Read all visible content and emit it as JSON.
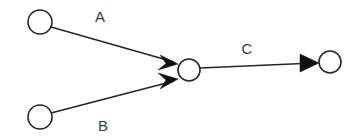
{
  "diagram": {
    "type": "directed-graph",
    "background_color": "#ffffff",
    "stroke_color": "#262626",
    "arrow_color": "#111111",
    "label_color": "#3a3a3a",
    "nodes": [
      {
        "id": "n1",
        "name": "node-top-left",
        "cx": 40,
        "cy": 22,
        "r": 12
      },
      {
        "id": "n2",
        "name": "node-bottom-left",
        "cx": 40,
        "cy": 117,
        "r": 12
      },
      {
        "id": "n3",
        "name": "node-center",
        "cx": 189,
        "cy": 70,
        "r": 11
      },
      {
        "id": "n4",
        "name": "node-right",
        "cx": 330,
        "cy": 62,
        "r": 11
      }
    ],
    "edges": [
      {
        "id": "e1",
        "name": "edge-a",
        "label": "A",
        "from": "n1",
        "to": "n3",
        "x1": 51,
        "y1": 27,
        "x2": 178,
        "y2": 64,
        "label_x": 100,
        "label_y": 22
      },
      {
        "id": "e2",
        "name": "edge-b",
        "label": "B",
        "from": "n2",
        "to": "n3",
        "x1": 51,
        "y1": 113,
        "x2": 178,
        "y2": 80,
        "label_x": 103,
        "label_y": 131
      },
      {
        "id": "e3",
        "name": "edge-c",
        "label": "C",
        "from": "n3",
        "to": "n4",
        "x1": 200,
        "y1": 68,
        "x2": 319,
        "y2": 63,
        "label_x": 247,
        "label_y": 54
      }
    ]
  }
}
